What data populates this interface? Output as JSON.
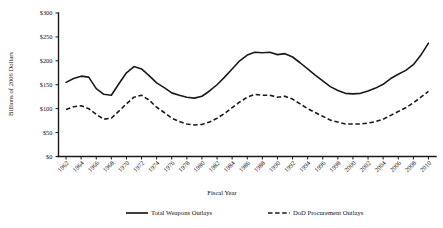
{
  "chart_data": {
    "type": "line",
    "title": "",
    "xlabel": "Fiscal Year",
    "ylabel": "Billions of 2006 Dollars",
    "xlim": [
      1961,
      2011
    ],
    "ylim": [
      0,
      300
    ],
    "ytick_values": [
      0,
      50,
      100,
      150,
      200,
      250,
      300
    ],
    "ytick_labels": [
      "$0",
      "$50",
      "$100",
      "$150",
      "$200",
      "$250",
      "$300"
    ],
    "xtick_labels": [
      "1962",
      "1964",
      "1966",
      "1968",
      "1970",
      "1972",
      "1974",
      "1976",
      "1978",
      "1980",
      "1982",
      "1984",
      "1986",
      "1988",
      "1990",
      "1992",
      "1994",
      "1996",
      "1998",
      "2000",
      "2002",
      "2004",
      "2006",
      "2008",
      "2010"
    ],
    "grid": false,
    "legend_position": "bottom",
    "x": [
      1962,
      1963,
      1964,
      1965,
      1966,
      1967,
      1968,
      1969,
      1970,
      1971,
      1972,
      1973,
      1974,
      1975,
      1976,
      1977,
      1978,
      1979,
      1980,
      1981,
      1982,
      1983,
      1984,
      1985,
      1986,
      1987,
      1988,
      1989,
      1990,
      1991,
      1992,
      1993,
      1994,
      1995,
      1996,
      1997,
      1998,
      1999,
      2000,
      2001,
      2002,
      2003,
      2004,
      2005,
      2006,
      2007,
      2008,
      2009,
      2010
    ],
    "series": [
      {
        "name": "Total Weapons Outlays",
        "style": "solid",
        "color": "#1a1a1a",
        "values": [
          155,
          163,
          168,
          166,
          142,
          130,
          128,
          152,
          175,
          188,
          183,
          169,
          154,
          144,
          133,
          128,
          124,
          122,
          126,
          137,
          150,
          166,
          183,
          200,
          212,
          218,
          217,
          218,
          213,
          215,
          208,
          196,
          183,
          170,
          158,
          146,
          138,
          132,
          131,
          132,
          137,
          143,
          151,
          163,
          172,
          180,
          192,
          212,
          237
        ]
      },
      {
        "name": "DoD Procurement Outlays",
        "style": "dashed",
        "color": "#1a1a1a",
        "values": [
          98,
          104,
          106,
          100,
          88,
          78,
          80,
          95,
          110,
          124,
          128,
          118,
          103,
          92,
          80,
          73,
          68,
          66,
          67,
          72,
          80,
          90,
          102,
          114,
          124,
          130,
          128,
          128,
          124,
          126,
          120,
          110,
          100,
          92,
          84,
          76,
          72,
          68,
          68,
          68,
          70,
          73,
          78,
          86,
          94,
          102,
          112,
          124,
          136
        ]
      }
    ],
    "legend": [
      {
        "label": "Total Weapons Outlays",
        "style": "solid"
      },
      {
        "label": "DoD Procurement Outlays",
        "style": "dashed"
      }
    ]
  }
}
